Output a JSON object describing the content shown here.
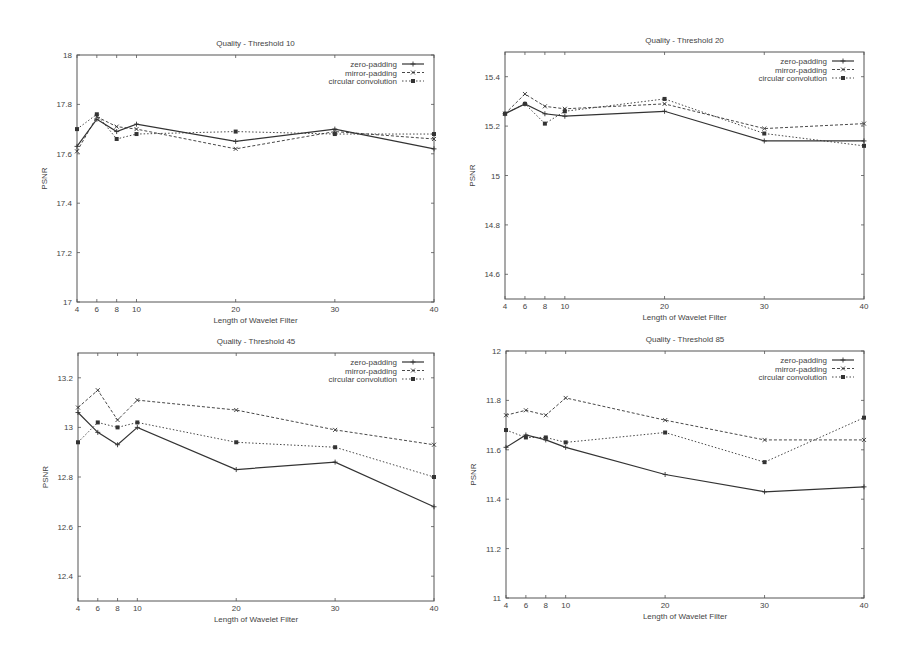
{
  "chart_data": [
    {
      "type": "line",
      "title": "Quality - Threshold 10",
      "xlabel": "Length of Wavelet Filter",
      "ylabel": "PSNR",
      "x": [
        4,
        6,
        8,
        10,
        20,
        30,
        40
      ],
      "xticks": [
        4,
        6,
        8,
        10,
        20,
        30,
        40
      ],
      "yticks": [
        17,
        17.2,
        17.4,
        17.6,
        17.8,
        18
      ],
      "ytick_labels": [
        "17",
        "17.2",
        "17.4",
        "17.6",
        "17.8",
        "18"
      ],
      "ylim": [
        17,
        18
      ],
      "grid": false,
      "legend_position": "upper right",
      "series": [
        {
          "name": "zero-padding",
          "values": [
            17.63,
            17.74,
            17.69,
            17.72,
            17.65,
            17.7,
            17.62
          ]
        },
        {
          "name": "mirror-padding",
          "values": [
            17.61,
            17.75,
            17.71,
            17.7,
            17.62,
            17.69,
            17.66
          ]
        },
        {
          "name": "circular convolution",
          "values": [
            17.7,
            17.76,
            17.66,
            17.68,
            17.69,
            17.68,
            17.68
          ]
        }
      ]
    },
    {
      "type": "line",
      "title": "Quality - Threshold 20",
      "xlabel": "Length of Wavelet Filter",
      "ylabel": "PSNR",
      "x": [
        4,
        6,
        8,
        10,
        20,
        30,
        40
      ],
      "xticks": [
        4,
        6,
        8,
        10,
        20,
        30,
        40
      ],
      "yticks": [
        14.6,
        14.8,
        15,
        15.2,
        15.4
      ],
      "ytick_labels": [
        "14.6",
        "14.8",
        "15",
        "15.2",
        "15.4"
      ],
      "ylim": [
        14.5,
        15.5
      ],
      "grid": false,
      "legend_position": "upper right",
      "series": [
        {
          "name": "zero-padding",
          "values": [
            15.25,
            15.29,
            15.25,
            15.24,
            15.26,
            15.14,
            15.14
          ]
        },
        {
          "name": "mirror-padding",
          "values": [
            15.25,
            15.33,
            15.28,
            15.27,
            15.29,
            15.19,
            15.21
          ]
        },
        {
          "name": "circular convolution",
          "values": [
            15.25,
            15.29,
            15.21,
            15.26,
            15.31,
            15.17,
            15.12
          ]
        }
      ]
    },
    {
      "type": "line",
      "title": "Quality - Threshold 45",
      "xlabel": "Length of Wavelet Filter",
      "ylabel": "PSNR",
      "x": [
        4,
        6,
        8,
        10,
        20,
        30,
        40
      ],
      "xticks": [
        4,
        6,
        8,
        10,
        20,
        30,
        40
      ],
      "yticks": [
        12.4,
        12.6,
        12.8,
        13,
        13.2
      ],
      "ytick_labels": [
        "12.4",
        "12.6",
        "12.8",
        "13",
        "13.2"
      ],
      "ylim": [
        12.3,
        13.3
      ],
      "grid": false,
      "legend_position": "upper right",
      "series": [
        {
          "name": "zero-padding",
          "values": [
            13.06,
            12.98,
            12.93,
            13.0,
            12.83,
            12.86,
            12.68
          ]
        },
        {
          "name": "mirror-padding",
          "values": [
            13.08,
            13.15,
            13.03,
            13.11,
            13.07,
            12.99,
            12.93
          ]
        },
        {
          "name": "circular convolution",
          "values": [
            12.94,
            13.02,
            13.0,
            13.02,
            12.94,
            12.92,
            12.8
          ]
        }
      ]
    },
    {
      "type": "line",
      "title": "Quality - Threshold 85",
      "xlabel": "Length of Wavelet Filter",
      "ylabel": "PSNR",
      "x": [
        4,
        6,
        8,
        10,
        20,
        30,
        40
      ],
      "xticks": [
        4,
        6,
        8,
        10,
        20,
        30,
        40
      ],
      "yticks": [
        11,
        11.2,
        11.4,
        11.6,
        11.8,
        12
      ],
      "ytick_labels": [
        "11",
        "11.2",
        "11.4",
        "11.6",
        "11.8",
        "12"
      ],
      "ylim": [
        11,
        12
      ],
      "grid": false,
      "legend_position": "upper right",
      "series": [
        {
          "name": "zero-padding",
          "values": [
            11.61,
            11.66,
            11.64,
            11.61,
            11.5,
            11.43,
            11.45
          ]
        },
        {
          "name": "mirror-padding",
          "values": [
            11.74,
            11.76,
            11.74,
            11.81,
            11.72,
            11.64,
            11.64
          ]
        },
        {
          "name": "circular convolution",
          "values": [
            11.68,
            11.65,
            11.65,
            11.63,
            11.67,
            11.55,
            11.73
          ]
        }
      ]
    }
  ],
  "layout": {
    "frames": [
      {
        "left": 77,
        "right": 434,
        "top": 55,
        "bottom": 302
      },
      {
        "left": 505,
        "right": 864,
        "top": 52,
        "bottom": 299
      },
      {
        "left": 78,
        "right": 434,
        "top": 353,
        "bottom": 601
      },
      {
        "left": 506,
        "right": 864,
        "top": 351,
        "bottom": 598
      }
    ],
    "line_color": "#333333",
    "series_styles": [
      {
        "dash": "",
        "marker": "plus",
        "width": 1.2
      },
      {
        "dash": "3,2",
        "marker": "x",
        "width": 0.9
      },
      {
        "dash": "1.5,2",
        "marker": "square",
        "width": 0.9
      }
    ]
  }
}
